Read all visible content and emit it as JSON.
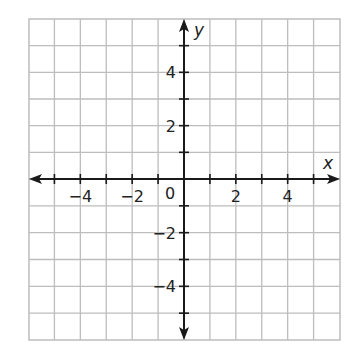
{
  "chart_data": {
    "type": "scatter",
    "title": "",
    "xlabel": "x",
    "ylabel": "y",
    "xlim": [
      -6,
      6
    ],
    "ylim": [
      -6,
      6
    ],
    "grid": true,
    "x_ticks": [
      -4,
      -2,
      2,
      4
    ],
    "y_ticks": [
      4,
      2,
      -2,
      -4
    ],
    "x_tick_labels": [
      "−4",
      "−2",
      "2",
      "4"
    ],
    "y_tick_labels": [
      "4",
      "2",
      "−2",
      "−4"
    ],
    "origin_label": "0",
    "series": [],
    "colors": {
      "grid": "#bdbdbd",
      "axis": "#1a1a1a",
      "background": "#ffffff"
    }
  }
}
